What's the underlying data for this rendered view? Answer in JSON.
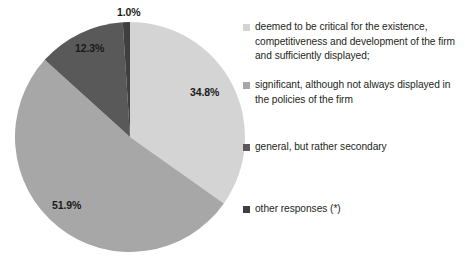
{
  "chart_data": {
    "type": "pie",
    "title": "",
    "subtitle": "",
    "xlabel": "",
    "ylabel": "",
    "grid": false,
    "legend_position": "right",
    "categories": [
      "deemed to be critical for the existence, competitiveness and development of the firm and sufficiently displayed;",
      "significant, although not always displayed in the  policies of the firm",
      "general, but rather secondary",
      "other responses (*)"
    ],
    "values": [
      34.8,
      51.9,
      12.3,
      1.0
    ],
    "value_labels": [
      "34.8%",
      "51.9%",
      "12.3%",
      "1.0%"
    ],
    "colors": [
      "#d4d4d4",
      "#a7a7a7",
      "#595959",
      "#3f3f3f"
    ],
    "start_angle_deg": 0,
    "direction": "clockwise"
  },
  "pie": {
    "slices": [
      {
        "label": "34.8%",
        "value": 34.8,
        "color": "#d4d4d4",
        "name": "slice-critical"
      },
      {
        "label": "51.9%",
        "value": 51.9,
        "color": "#a7a7a7",
        "name": "slice-significant"
      },
      {
        "label": "12.3%",
        "value": 12.3,
        "color": "#595959",
        "name": "slice-general"
      },
      {
        "label": "1.0%",
        "value": 1.0,
        "color": "#3f3f3f",
        "name": "slice-other"
      }
    ]
  },
  "legend": {
    "items": [
      {
        "line1": "deemed to be critical for the existence,",
        "line2": "competitiveness and development of the firm",
        "line3": "and sufficiently displayed;",
        "color": "#d4d4d4"
      },
      {
        "line1": "significant, although not always displayed in",
        "line2": "the  policies of the firm",
        "line3": "",
        "color": "#a7a7a7"
      },
      {
        "line1": "general, but rather secondary",
        "line2": "",
        "line3": "",
        "color": "#595959"
      },
      {
        "line1": "other responses (*)",
        "line2": "",
        "line3": "",
        "color": "#3f3f3f"
      }
    ]
  }
}
